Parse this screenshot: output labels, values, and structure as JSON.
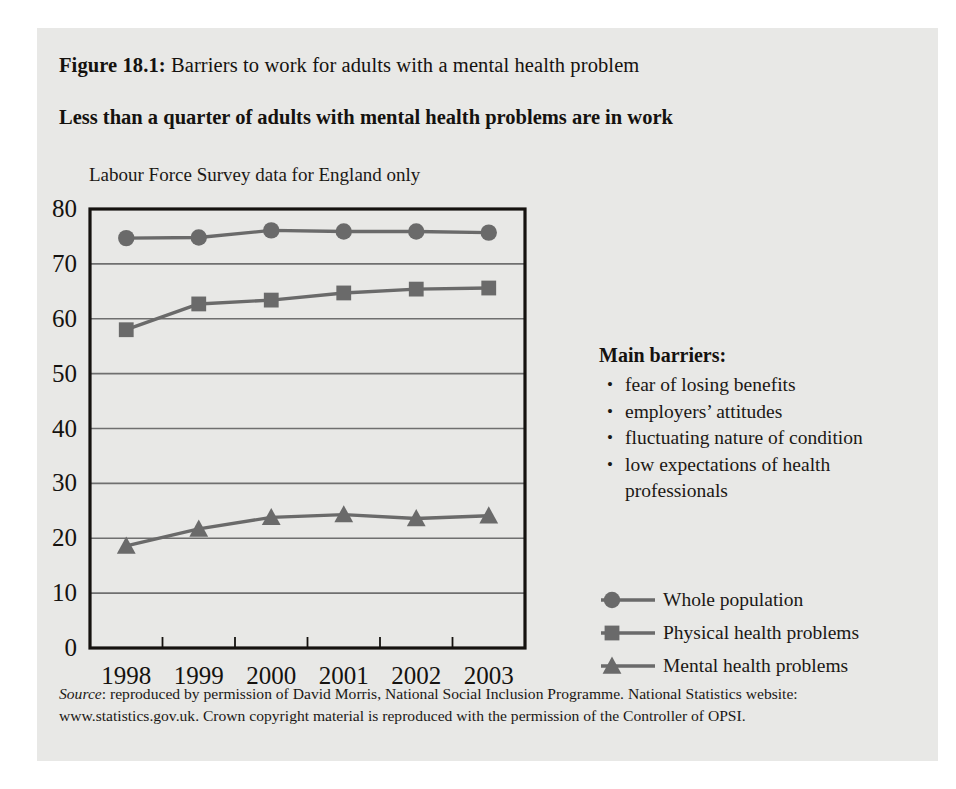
{
  "figure": {
    "label": "Figure 18.1:",
    "title": " Barriers to work for adults with a mental health problem",
    "subtitle": "Less than a quarter of adults with mental health problems are in work"
  },
  "barriers": {
    "heading": "Main barriers:",
    "bullet_glyph": "•",
    "items": [
      "fear of losing benefits",
      "employers’ attitudes",
      "fluctuating nature of condition",
      "low expectations of health professionals"
    ]
  },
  "source": {
    "label": "Source",
    "text": ": reproduced by permission of David Morris, National Social Inclusion Programme. National Statistics website: www.statistics.gov.uk. Crown copyright material is reproduced with the permission of the Controller of OPSI."
  },
  "colors": {
    "card_background": "#e8e8e6",
    "series": "#6a6a6a",
    "axis": "#15120f",
    "gridline": "#6f6f6f",
    "text": "#1b1815"
  },
  "chart_data": {
    "type": "line",
    "title": "Labour Force Survey data for England only",
    "xlabel": "",
    "ylabel": "",
    "x": [
      "1998",
      "1999",
      "2000",
      "2001",
      "2002",
      "2003"
    ],
    "categories": [
      "1998",
      "1999",
      "2000",
      "2001",
      "2002",
      "2003"
    ],
    "ylim": [
      0,
      80
    ],
    "yticks": [
      0,
      10,
      20,
      30,
      40,
      50,
      60,
      70,
      80
    ],
    "grid": true,
    "legend_position": "right",
    "series": [
      {
        "name": "Whole population",
        "marker": "circle",
        "values": [
          74.7,
          74.8,
          76.1,
          75.9,
          75.9,
          75.7
        ]
      },
      {
        "name": "Physical health problems",
        "marker": "square",
        "values": [
          58.0,
          62.7,
          63.4,
          64.7,
          65.4,
          65.6
        ]
      },
      {
        "name": "Mental health problems",
        "marker": "triangle",
        "values": [
          18.6,
          21.7,
          23.8,
          24.3,
          23.6,
          24.1
        ]
      }
    ]
  }
}
